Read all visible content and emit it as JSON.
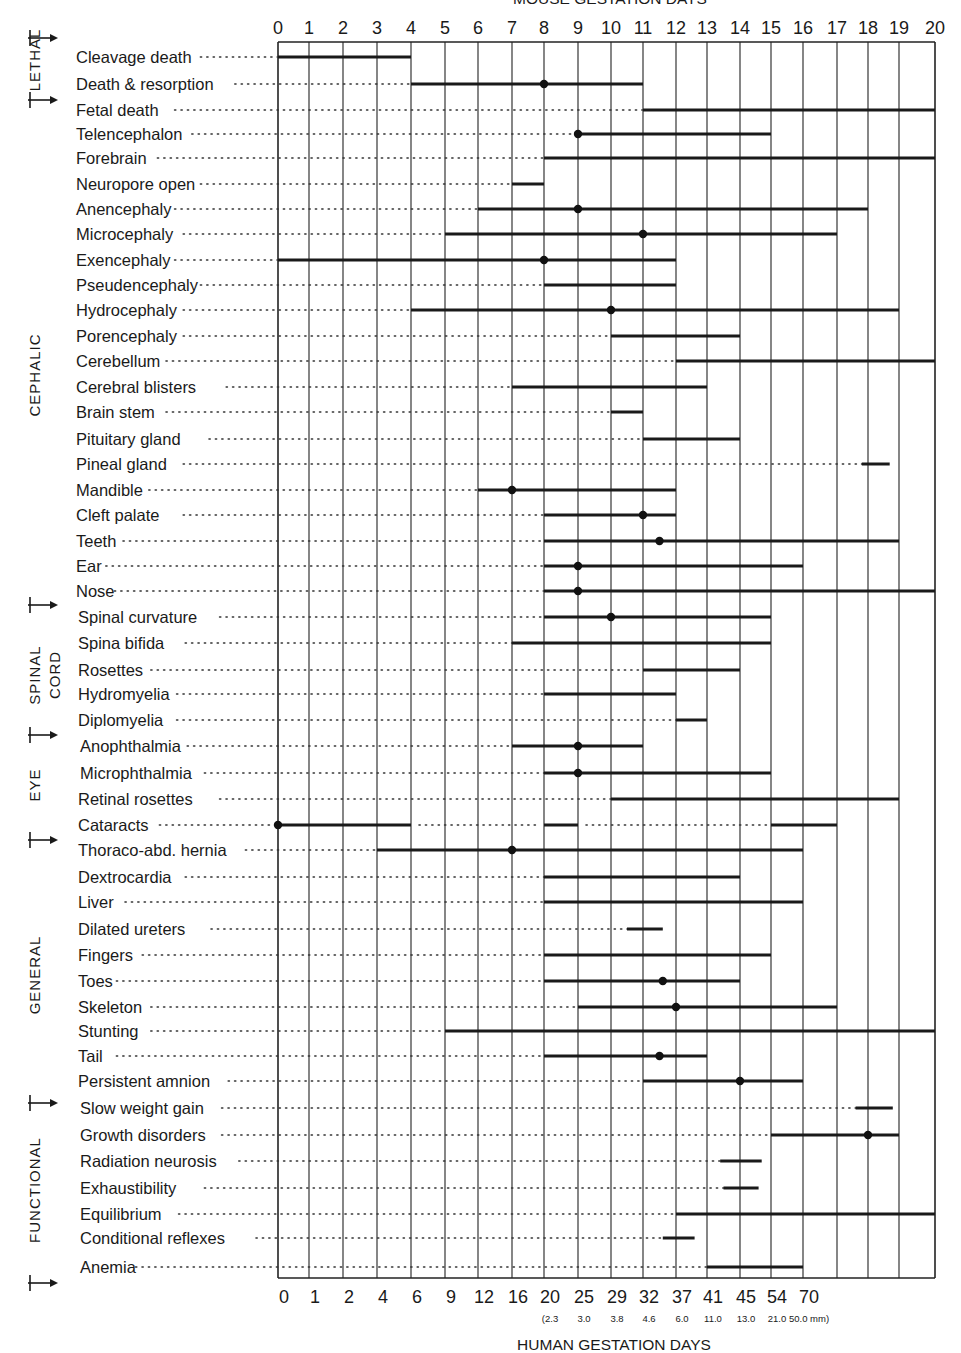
{
  "chart_data": {
    "type": "range-bar",
    "title": "MOUSE GESTATION DAYS",
    "xlabel_top": "MOUSE GESTATION DAYS",
    "xlabel_bottom": "HUMAN GESTATION DAYS",
    "top_ticks": [
      "0",
      "1",
      "2",
      "3",
      "4",
      "5",
      "6",
      "7",
      "8",
      "9",
      "10",
      "11",
      "12",
      "13",
      "14",
      "15",
      "16",
      "17",
      "18",
      "19",
      "20"
    ],
    "bottom_ticks": [
      "0",
      "1",
      "2",
      "4",
      "6",
      "9",
      "12",
      "16",
      "20",
      "25",
      "29",
      "32",
      "37",
      "41",
      "45",
      "54",
      "70"
    ],
    "bottom_subticks": [
      {
        "at": 8,
        "text": "(2.3"
      },
      {
        "at": 9,
        "text": "3.0"
      },
      {
        "at": 10,
        "text": "3.8"
      },
      {
        "at": 11,
        "text": "4.6"
      },
      {
        "at": 12,
        "text": "6.0"
      },
      {
        "at": 13,
        "text": "11.0"
      },
      {
        "at": 14,
        "text": "13.0"
      },
      {
        "at": 15,
        "text": "21.0"
      },
      {
        "at": 16,
        "text": "50.0 mm)"
      }
    ],
    "xlim": [
      0,
      20
    ],
    "grid": true,
    "sections": [
      {
        "name": "LETHAL",
        "from_row": 0,
        "to_row": 2
      },
      {
        "name": "CEPHALIC",
        "from_row": 3,
        "to_row": 21
      },
      {
        "name": "SPINAL CORD",
        "from_row": 22,
        "to_row": 26
      },
      {
        "name": "EYE",
        "from_row": 27,
        "to_row": 30
      },
      {
        "name": "GENERAL",
        "from_row": 31,
        "to_row": 41
      },
      {
        "name": "FUNCTIONAL",
        "from_row": 42,
        "to_row": 47
      }
    ],
    "rows": [
      {
        "label": "Cleavage death",
        "ranges": [
          [
            0,
            4
          ]
        ],
        "peak": null
      },
      {
        "label": "Death & resorption",
        "ranges": [
          [
            4,
            11
          ]
        ],
        "peak": 8
      },
      {
        "label": "Fetal death",
        "ranges": [
          [
            11,
            20
          ]
        ],
        "peak": null
      },
      {
        "label": "Telencephalon",
        "ranges": [
          [
            9,
            15
          ]
        ],
        "peak": 9
      },
      {
        "label": "Forebrain",
        "ranges": [
          [
            8,
            20
          ]
        ],
        "peak": null
      },
      {
        "label": "Neuropore open",
        "ranges": [
          [
            7,
            8
          ]
        ],
        "peak": null
      },
      {
        "label": "Anencephaly",
        "ranges": [
          [
            6,
            18
          ]
        ],
        "peak": 9
      },
      {
        "label": "Microcephaly",
        "ranges": [
          [
            5,
            17
          ]
        ],
        "peak": 11
      },
      {
        "label": "Exencephaly",
        "ranges": [
          [
            0,
            12
          ]
        ],
        "peak": 8
      },
      {
        "label": "Pseudencephaly",
        "ranges": [
          [
            8,
            12
          ]
        ],
        "peak": null
      },
      {
        "label": "Hydrocephaly",
        "ranges": [
          [
            4,
            19
          ]
        ],
        "peak": 10
      },
      {
        "label": "Porencephaly",
        "ranges": [
          [
            10,
            14
          ]
        ],
        "peak": null
      },
      {
        "label": "Cerebellum",
        "ranges": [
          [
            12,
            20
          ]
        ],
        "peak": null
      },
      {
        "label": "Cerebral blisters",
        "ranges": [
          [
            7,
            13
          ]
        ],
        "peak": null
      },
      {
        "label": "Brain stem",
        "ranges": [
          [
            10,
            11
          ]
        ],
        "peak": null
      },
      {
        "label": "Pituitary gland",
        "ranges": [
          [
            11,
            14
          ]
        ],
        "peak": null
      },
      {
        "label": "Pineal gland",
        "ranges": [
          [
            17.8,
            18.7
          ]
        ],
        "peak": null
      },
      {
        "label": "Mandible",
        "ranges": [
          [
            6,
            12
          ]
        ],
        "peak": 7
      },
      {
        "label": "Cleft palate",
        "ranges": [
          [
            8,
            12
          ]
        ],
        "peak": 11
      },
      {
        "label": "Teeth",
        "ranges": [
          [
            8,
            19
          ]
        ],
        "peak": 11.5
      },
      {
        "label": "Ear",
        "ranges": [
          [
            8,
            16
          ]
        ],
        "peak": 9
      },
      {
        "label": "Nose",
        "ranges": [
          [
            8,
            20
          ]
        ],
        "peak": 9
      },
      {
        "label": "Spinal curvature",
        "ranges": [
          [
            8,
            15
          ]
        ],
        "peak": 10
      },
      {
        "label": "Spina bifida",
        "ranges": [
          [
            7,
            15
          ]
        ],
        "peak": null
      },
      {
        "label": "Rosettes",
        "ranges": [
          [
            11,
            14
          ]
        ],
        "peak": null
      },
      {
        "label": "Hydromyelia",
        "ranges": [
          [
            8,
            12
          ]
        ],
        "peak": null
      },
      {
        "label": "Diplomyelia",
        "ranges": [
          [
            12,
            13
          ]
        ],
        "peak": null
      },
      {
        "label": "Anophthalmia",
        "ranges": [
          [
            7,
            11
          ]
        ],
        "peak": 9
      },
      {
        "label": "Microphthalmia",
        "ranges": [
          [
            8,
            15
          ]
        ],
        "peak": 9
      },
      {
        "label": "Retinal rosettes",
        "ranges": [
          [
            10,
            19
          ]
        ],
        "peak": null
      },
      {
        "label": "Cataracts",
        "ranges": [
          [
            0,
            4
          ],
          [
            8,
            9
          ],
          [
            15,
            17
          ]
        ],
        "peak": 0
      },
      {
        "label": "Thoraco-abd. hernia",
        "ranges": [
          [
            3,
            16
          ]
        ],
        "peak": 7
      },
      {
        "label": "Dextrocardia",
        "ranges": [
          [
            8,
            14
          ]
        ],
        "peak": null
      },
      {
        "label": "Liver",
        "ranges": [
          [
            8,
            16
          ]
        ],
        "peak": null
      },
      {
        "label": "Dilated ureters",
        "ranges": [
          [
            10.5,
            11.6
          ]
        ],
        "peak": null
      },
      {
        "label": "Fingers",
        "ranges": [
          [
            8,
            15
          ]
        ],
        "peak": null
      },
      {
        "label": "Toes",
        "ranges": [
          [
            8,
            14
          ]
        ],
        "peak": 11.6
      },
      {
        "label": "Skeleton",
        "ranges": [
          [
            9,
            17
          ]
        ],
        "peak": 12
      },
      {
        "label": "Stunting",
        "ranges": [
          [
            5,
            20
          ]
        ],
        "peak": null
      },
      {
        "label": "Tail",
        "ranges": [
          [
            8,
            13
          ]
        ],
        "peak": 11.5
      },
      {
        "label": "Persistent amnion",
        "ranges": [
          [
            11,
            16
          ]
        ],
        "peak": 14
      },
      {
        "label": "Slow weight gain",
        "ranges": [
          [
            17.6,
            18.8
          ]
        ],
        "peak": null
      },
      {
        "label": "Growth disorders",
        "ranges": [
          [
            15,
            19
          ]
        ],
        "peak": 18
      },
      {
        "label": "Radiation neurosis",
        "ranges": [
          [
            13.4,
            14.7
          ]
        ],
        "peak": null
      },
      {
        "label": "Exhaustibility",
        "ranges": [
          [
            13.5,
            14.6
          ]
        ],
        "peak": null
      },
      {
        "label": "Equilibrium",
        "ranges": [
          [
            12,
            20
          ]
        ],
        "peak": null
      },
      {
        "label": "Conditional reflexes",
        "ranges": [
          [
            11.6,
            12.6
          ]
        ],
        "peak": null
      },
      {
        "label": "Anemia",
        "ranges": [
          [
            13,
            16
          ]
        ],
        "peak": null
      }
    ]
  }
}
